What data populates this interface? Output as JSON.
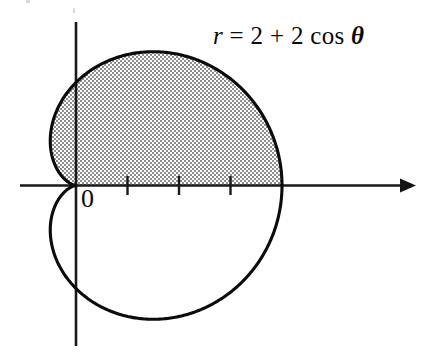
{
  "figure": {
    "title": "",
    "equation": {
      "lhs": "r",
      "relation": "=",
      "rhs_const": "2",
      "plus": "+",
      "rhs_coef": "2",
      "rhs_func": "cos",
      "rhs_var": "θ",
      "full_text": "r = 2 + 2 cos θ"
    },
    "origin_label": "0",
    "colors": {
      "curve": "#0b0b0b",
      "axis": "#1a1a1a",
      "shading": "#b4b4b4",
      "background": "#ffffff"
    }
  },
  "chart_data": {
    "type": "line",
    "plot_kind": "polar-cardioid",
    "equation": "r = 2 + 2 cos(theta)",
    "curve_params": {
      "a": 2,
      "b": 2
    },
    "theta_range_deg": [
      0,
      360
    ],
    "r_max": 4,
    "r_min": 0,
    "xlabel": "",
    "ylabel": "",
    "grid": false,
    "legend": "none",
    "axes": {
      "x_axis": {
        "visible": true,
        "arrow_at": "right",
        "tick_values": [
          1,
          2,
          3
        ],
        "tick_labels": [
          "",
          "",
          ""
        ],
        "origin_label": "0",
        "range_units": [
          -1.1,
          6.5
        ]
      },
      "y_axis": {
        "visible": true,
        "arrow_at": "none",
        "tick_values": [],
        "tick_labels": [],
        "range_units": [
          -3.2,
          3.2
        ]
      }
    },
    "shaded_region": {
      "label": "",
      "theta_range_deg": [
        0,
        180
      ],
      "description": "Upper half of the cardioid interior, shaded with a gray stipple pattern"
    },
    "key_points": [
      {
        "theta_deg": 0,
        "r": 4,
        "x": 4,
        "y": 0
      },
      {
        "theta_deg": 60,
        "r": 3,
        "x": 1.5,
        "y": 2.598
      },
      {
        "theta_deg": 90,
        "r": 2,
        "x": 0,
        "y": 2
      },
      {
        "theta_deg": 120,
        "r": 1,
        "x": -0.5,
        "y": 0.866
      },
      {
        "theta_deg": 180,
        "r": 0,
        "x": 0,
        "y": 0
      },
      {
        "theta_deg": 270,
        "r": 2,
        "x": 0,
        "y": -2
      }
    ]
  }
}
